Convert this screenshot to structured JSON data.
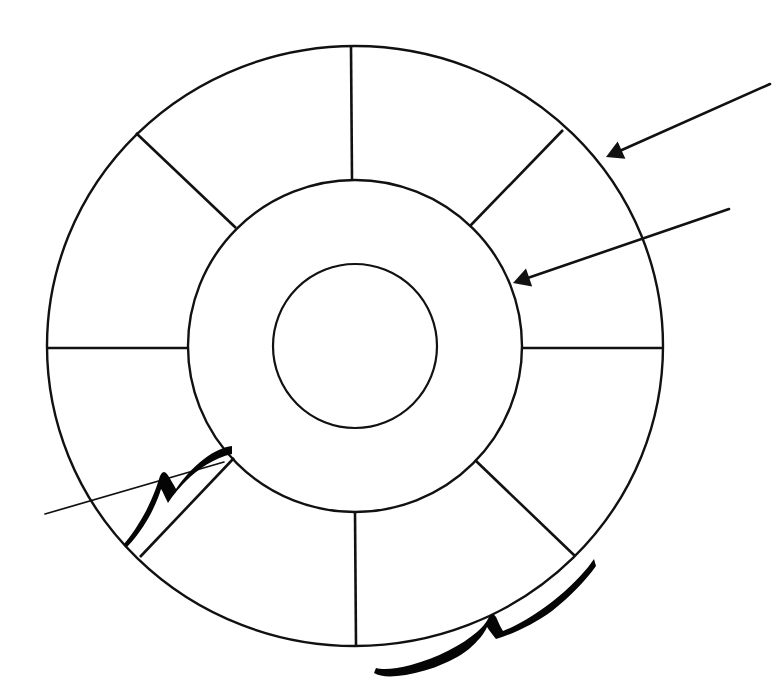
{
  "figure": {
    "kind": "patent-line-drawing",
    "background_color": "#ffffff",
    "line_color": "#111111",
    "canvas": {
      "width": 775,
      "height": 692
    }
  },
  "geometry": {
    "center": {
      "x": 355,
      "y": 346
    },
    "outer_circle": {
      "rx": 308,
      "ry": 300,
      "label": "outer-circle"
    },
    "middle_circle": {
      "rx": 167,
      "ry": 166,
      "label": "middle-circle"
    },
    "inner_circle": {
      "rx": 82,
      "ry": 82,
      "label": "inner-circle"
    },
    "segment_count": 8,
    "spoke_angles_deg": [
      0,
      45,
      90,
      135,
      180,
      225,
      270,
      315
    ]
  },
  "spokes": [
    {
      "name": "spoke-right",
      "angle_deg": 0,
      "x1": 522,
      "y1": 348,
      "x2": 663,
      "y2": 348
    },
    {
      "name": "spoke-upper-right",
      "angle_deg": 45,
      "x1": 470,
      "y1": 226,
      "x2": 563,
      "y2": 130
    },
    {
      "name": "spoke-top",
      "angle_deg": 90,
      "x1": 352,
      "y1": 180,
      "x2": 351,
      "y2": 47
    },
    {
      "name": "spoke-upper-left",
      "angle_deg": 135,
      "x1": 236,
      "y1": 228,
      "x2": 136,
      "y2": 133
    },
    {
      "name": "spoke-left",
      "angle_deg": 180,
      "x1": 188,
      "y1": 348,
      "x2": 47,
      "y2": 348
    },
    {
      "name": "spoke-lower-left",
      "angle_deg": 225,
      "x1": 234,
      "y1": 458,
      "x2": 140,
      "y2": 557
    },
    {
      "name": "spoke-bottom",
      "angle_deg": 270,
      "x1": 355,
      "y1": 512,
      "x2": 356,
      "y2": 645
    },
    {
      "name": "spoke-lower-right",
      "angle_deg": 315,
      "x1": 475,
      "y1": 460,
      "x2": 575,
      "y2": 556
    }
  ],
  "leaders": [
    {
      "name": "leader-outer-ring",
      "type": "arrow",
      "tip": {
        "x": 606,
        "y": 157
      },
      "tail": {
        "x": 770,
        "y": 84
      },
      "points_at": "outer-ring-band"
    },
    {
      "name": "leader-middle-ring",
      "type": "arrow",
      "tip": {
        "x": 513,
        "y": 283
      },
      "tail": {
        "x": 729,
        "y": 209
      },
      "points_at": "middle-ring-band"
    },
    {
      "name": "leader-left-brace",
      "type": "plain-line",
      "tip": {
        "x": 224,
        "y": 462
      },
      "tail": {
        "x": 45,
        "y": 514
      },
      "points_at": "left-squiggle-brace"
    }
  ],
  "braces": [
    {
      "name": "squiggle-brace-left",
      "orientation": "diagonal",
      "span_start": {
        "x": 126,
        "y": 545
      },
      "span_end": {
        "x": 231,
        "y": 455
      },
      "cusp": {
        "x": 172,
        "y": 492
      }
    },
    {
      "name": "squiggle-brace-bottom",
      "orientation": "horizontal",
      "span_start": {
        "x": 376,
        "y": 665
      },
      "span_end": {
        "x": 594,
        "y": 568
      },
      "cusp": {
        "x": 487,
        "y": 637
      }
    }
  ],
  "annotations": {
    "arrow_count": 2,
    "brace_count": 2,
    "leader_count": 3,
    "visible_text": []
  }
}
